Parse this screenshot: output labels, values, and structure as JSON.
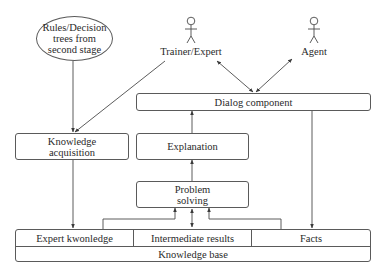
{
  "diagram": {
    "nodes": {
      "rules_source": {
        "lines": [
          "Rules/Decision",
          "trees from",
          "second stage"
        ]
      },
      "trainer_expert": {
        "label": "Trainer/Expert",
        "type": "actor"
      },
      "agent": {
        "label": "Agent",
        "type": "actor"
      },
      "dialog_component": {
        "label": "Dialog component"
      },
      "knowledge_acquisition": {
        "lines": [
          "Knowledge",
          "acquisition"
        ]
      },
      "explanation": {
        "label": "Explanation"
      },
      "problem_solving": {
        "lines": [
          "Problem",
          "solving"
        ]
      },
      "knowledge_base": {
        "label": "Knowledge base",
        "parts": [
          "Expert kwonledge",
          "Intermediate results",
          "Facts"
        ]
      }
    },
    "edges": [
      {
        "from": "rules_source",
        "to": "knowledge_acquisition",
        "direction": "forward"
      },
      {
        "from": "trainer_expert",
        "to": "knowledge_acquisition",
        "direction": "forward"
      },
      {
        "from": "trainer_expert",
        "to": "dialog_component",
        "direction": "both"
      },
      {
        "from": "agent",
        "to": "dialog_component",
        "direction": "both"
      },
      {
        "from": "knowledge_acquisition",
        "to": "expert_knowledge",
        "direction": "forward"
      },
      {
        "from": "explanation",
        "to": "dialog_component",
        "direction": "forward"
      },
      {
        "from": "problem_solving",
        "to": "explanation",
        "direction": "forward"
      },
      {
        "from": "expert_knowledge",
        "to": "problem_solving",
        "direction": "forward"
      },
      {
        "from": "intermediate_results",
        "to": "problem_solving",
        "direction": "both"
      },
      {
        "from": "facts",
        "to": "problem_solving",
        "direction": "forward"
      },
      {
        "from": "dialog_component",
        "to": "facts",
        "direction": "forward"
      }
    ]
  }
}
